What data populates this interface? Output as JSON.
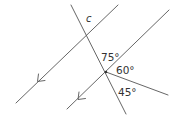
{
  "diagram": {
    "type": "geometry-angles",
    "labels": {
      "line_c": "c",
      "angle_top": "75°",
      "angle_middle": "60°",
      "angle_bottom": "45°"
    },
    "lines": {
      "parallel_left": {
        "x1": 118,
        "y1": 5,
        "x2": 16,
        "y2": 103
      },
      "parallel_right": {
        "x1": 169,
        "y1": 10,
        "x2": 67,
        "y2": 109
      },
      "transversal_c": {
        "x1": 71,
        "y1": 5,
        "x2": 126,
        "y2": 114
      },
      "ray": {
        "x1": 106,
        "y1": 72,
        "x2": 168,
        "y2": 95
      }
    },
    "vertex": {
      "x": 106,
      "y": 72
    },
    "stroke_color": "#555555",
    "text_color": "#333333"
  }
}
